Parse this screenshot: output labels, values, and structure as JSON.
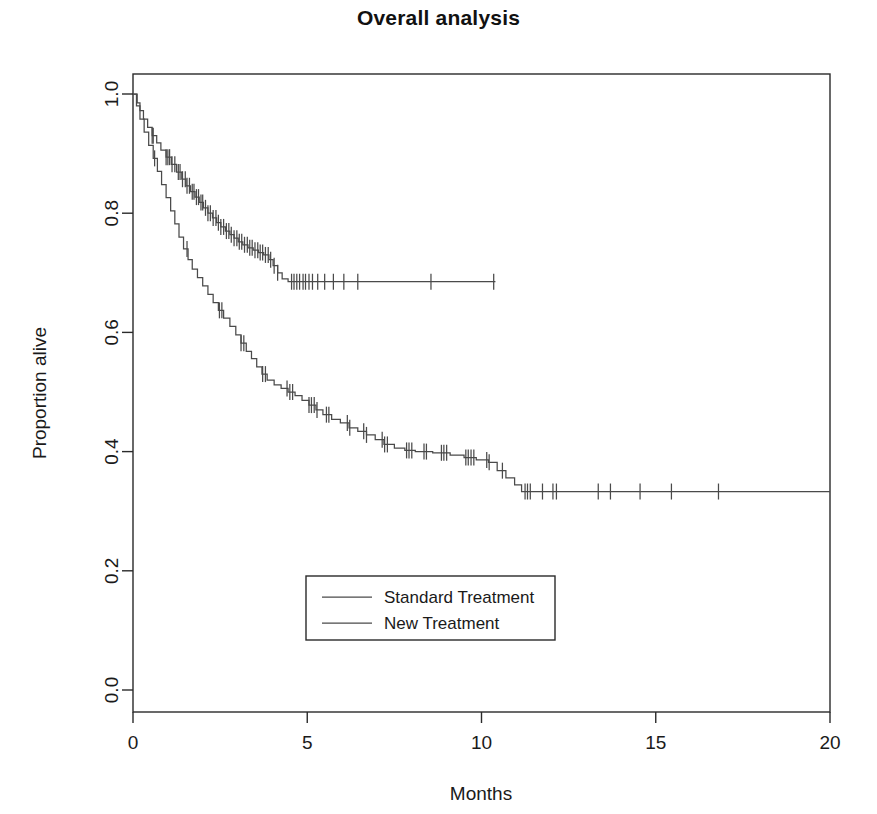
{
  "chart_data": {
    "type": "line",
    "subtype": "kaplan-meier-survival",
    "title": "Overall analysis",
    "xlabel": "Months",
    "ylabel": "Proportion alive",
    "xlim": [
      0,
      20
    ],
    "ylim": [
      0,
      1
    ],
    "xticks": [
      0,
      5,
      10,
      15,
      20
    ],
    "xticklabels": [
      "0",
      "5",
      "10",
      "15",
      "20"
    ],
    "yticks": [
      0.0,
      0.2,
      0.4,
      0.6,
      0.8,
      1.0
    ],
    "yticklabels": [
      "0.0",
      "0.2",
      "0.4",
      "0.6",
      "0.8",
      "1.0"
    ],
    "grid": false,
    "legend_position": "center-bottom-inside",
    "line_color": "#4a4a4a",
    "frame_color": "#2a2a2a",
    "series": [
      {
        "name": "New Treatment",
        "legend_index": 1,
        "final_value": 0.685,
        "follow_up_end_months": 10.4,
        "steps": [
          [
            0.0,
            1.0
          ],
          [
            0.12,
            0.985
          ],
          [
            0.2,
            0.972
          ],
          [
            0.3,
            0.958
          ],
          [
            0.42,
            0.944
          ],
          [
            0.55,
            0.93
          ],
          [
            0.68,
            0.918
          ],
          [
            0.8,
            0.906
          ],
          [
            0.95,
            0.894
          ],
          [
            1.1,
            0.882
          ],
          [
            1.25,
            0.869
          ],
          [
            1.4,
            0.857
          ],
          [
            1.52,
            0.846
          ],
          [
            1.65,
            0.836
          ],
          [
            1.78,
            0.827
          ],
          [
            1.9,
            0.818
          ],
          [
            2.02,
            0.809
          ],
          [
            2.15,
            0.8
          ],
          [
            2.28,
            0.792
          ],
          [
            2.4,
            0.784
          ],
          [
            2.52,
            0.777
          ],
          [
            2.65,
            0.77
          ],
          [
            2.78,
            0.764
          ],
          [
            2.9,
            0.758
          ],
          [
            3.02,
            0.752
          ],
          [
            3.15,
            0.747
          ],
          [
            3.3,
            0.742
          ],
          [
            3.45,
            0.738
          ],
          [
            3.6,
            0.734
          ],
          [
            3.75,
            0.73
          ],
          [
            3.9,
            0.722
          ],
          [
            4.02,
            0.712
          ],
          [
            4.15,
            0.7
          ],
          [
            4.28,
            0.69
          ],
          [
            4.45,
            0.685
          ],
          [
            10.4,
            0.685
          ]
        ],
        "censor_times": [
          0.55,
          0.58,
          0.95,
          1.0,
          1.05,
          1.12,
          1.2,
          1.3,
          1.35,
          1.42,
          1.5,
          1.55,
          1.62,
          1.7,
          1.75,
          1.82,
          1.88,
          1.95,
          2.0,
          2.08,
          2.15,
          2.22,
          2.3,
          2.38,
          2.45,
          2.52,
          2.6,
          2.68,
          2.75,
          2.82,
          2.9,
          2.98,
          3.05,
          3.12,
          3.2,
          3.28,
          3.35,
          3.42,
          3.5,
          3.58,
          3.65,
          3.72,
          3.8,
          3.88,
          3.95,
          4.05,
          4.15,
          4.55,
          4.62,
          4.7,
          4.78,
          4.88,
          4.95,
          5.05,
          5.15,
          5.3,
          5.5,
          5.75,
          6.05,
          6.45,
          8.55,
          10.35
        ]
      },
      {
        "name": "Standard Treatment",
        "legend_index": 0,
        "final_value": 0.333,
        "follow_up_end_months": 20.0,
        "steps": [
          [
            0.0,
            1.0
          ],
          [
            0.1,
            0.98
          ],
          [
            0.2,
            0.958
          ],
          [
            0.32,
            0.936
          ],
          [
            0.45,
            0.914
          ],
          [
            0.58,
            0.892
          ],
          [
            0.7,
            0.87
          ],
          [
            0.82,
            0.848
          ],
          [
            0.95,
            0.826
          ],
          [
            1.08,
            0.804
          ],
          [
            1.2,
            0.782
          ],
          [
            1.32,
            0.76
          ],
          [
            1.45,
            0.74
          ],
          [
            1.58,
            0.722
          ],
          [
            1.7,
            0.706
          ],
          [
            1.85,
            0.692
          ],
          [
            2.0,
            0.678
          ],
          [
            2.15,
            0.664
          ],
          [
            2.3,
            0.65
          ],
          [
            2.45,
            0.637
          ],
          [
            2.6,
            0.624
          ],
          [
            2.78,
            0.61
          ],
          [
            2.95,
            0.596
          ],
          [
            3.1,
            0.582
          ],
          [
            3.25,
            0.568
          ],
          [
            3.4,
            0.556
          ],
          [
            3.55,
            0.542
          ],
          [
            3.7,
            0.53
          ],
          [
            3.85,
            0.52
          ],
          [
            4.05,
            0.512
          ],
          [
            4.25,
            0.506
          ],
          [
            4.45,
            0.5
          ],
          [
            4.65,
            0.494
          ],
          [
            4.85,
            0.486
          ],
          [
            5.05,
            0.478
          ],
          [
            5.25,
            0.47
          ],
          [
            5.45,
            0.462
          ],
          [
            5.7,
            0.454
          ],
          [
            5.95,
            0.448
          ],
          [
            6.2,
            0.44
          ],
          [
            6.45,
            0.434
          ],
          [
            6.7,
            0.428
          ],
          [
            6.95,
            0.42
          ],
          [
            7.2,
            0.412
          ],
          [
            7.5,
            0.406
          ],
          [
            7.8,
            0.402
          ],
          [
            8.1,
            0.4
          ],
          [
            8.6,
            0.398
          ],
          [
            9.1,
            0.394
          ],
          [
            9.5,
            0.39
          ],
          [
            9.85,
            0.386
          ],
          [
            10.2,
            0.382
          ],
          [
            10.45,
            0.368
          ],
          [
            10.7,
            0.356
          ],
          [
            10.95,
            0.344
          ],
          [
            11.15,
            0.333
          ],
          [
            20.0,
            0.333
          ]
        ],
        "censor_times": [
          0.62,
          1.55,
          2.48,
          2.55,
          3.1,
          3.18,
          3.72,
          3.8,
          4.42,
          4.5,
          4.58,
          5.05,
          5.12,
          5.2,
          5.28,
          5.55,
          5.62,
          6.15,
          6.22,
          6.62,
          6.7,
          7.15,
          7.22,
          7.3,
          7.85,
          7.92,
          8.0,
          8.35,
          8.42,
          8.85,
          8.92,
          9.0,
          9.55,
          9.62,
          9.7,
          9.78,
          10.15,
          10.22,
          10.6,
          11.25,
          11.32,
          11.4,
          11.75,
          12.05,
          12.15,
          13.35,
          13.7,
          14.55,
          15.45,
          16.8
        ]
      }
    ],
    "legend_entries": [
      {
        "label": "Standard Treatment"
      },
      {
        "label": "New Treatment"
      }
    ]
  }
}
